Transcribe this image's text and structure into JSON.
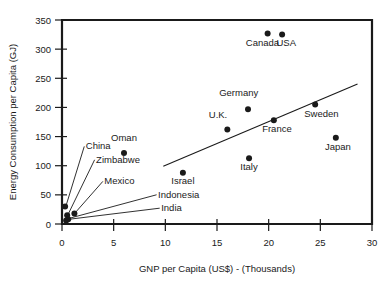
{
  "chart_data": {
    "type": "scatter",
    "title": "",
    "xlabel": "GNP per Capita (US$) - (Thousands)",
    "ylabel": "Energy Consumption per Capita (GJ)",
    "xlim": [
      0,
      30
    ],
    "ylim": [
      0,
      350
    ],
    "xticks": [
      0,
      5,
      10,
      15,
      20,
      25,
      30
    ],
    "yticks": [
      0,
      50,
      100,
      150,
      200,
      250,
      300,
      350
    ],
    "xtick_labels": [
      "0",
      "5",
      "10",
      "15",
      "20",
      "25",
      "30"
    ],
    "ytick_labels": [
      "0",
      "50",
      "100",
      "150",
      "200",
      "250",
      "300",
      "350"
    ],
    "grid": false,
    "legend": false,
    "points": [
      {
        "name": "China",
        "x": 0.3,
        "y": 30,
        "label_x": 2.3,
        "label_y": 128,
        "leader": true
      },
      {
        "name": "Zimbabwe",
        "x": 0.5,
        "y": 15,
        "label_x": 3.3,
        "label_y": 105,
        "leader": true
      },
      {
        "name": "Mexico",
        "x": 1.2,
        "y": 18,
        "label_x": 4.1,
        "label_y": 68,
        "leader": true
      },
      {
        "name": "Indonesia",
        "x": 0.6,
        "y": 8,
        "label_x": 9.3,
        "label_y": 45,
        "leader": true
      },
      {
        "name": "India",
        "x": 0.4,
        "y": 6,
        "label_x": 9.6,
        "label_y": 22,
        "leader": true
      },
      {
        "name": "Oman",
        "x": 6.0,
        "y": 122,
        "label_x": 6.0,
        "label_y": 143,
        "leader": false
      },
      {
        "name": "Israel",
        "x": 11.7,
        "y": 88,
        "label_x": 11.7,
        "label_y": 68,
        "leader": false
      },
      {
        "name": "U.K.",
        "x": 16.0,
        "y": 162,
        "label_x": 15.1,
        "label_y": 182,
        "leader": false
      },
      {
        "name": "Germany",
        "x": 18.0,
        "y": 197,
        "label_x": 17.1,
        "label_y": 220,
        "leader": false
      },
      {
        "name": "Italy",
        "x": 18.1,
        "y": 113,
        "label_x": 18.1,
        "label_y": 93,
        "leader": false
      },
      {
        "name": "France",
        "x": 20.5,
        "y": 178,
        "label_x": 20.8,
        "label_y": 157,
        "leader": false
      },
      {
        "name": "Canada",
        "x": 19.9,
        "y": 327,
        "label_x": 19.4,
        "label_y": 305,
        "leader": false
      },
      {
        "name": "USA",
        "x": 21.3,
        "y": 325,
        "label_x": 21.7,
        "label_y": 305,
        "leader": false
      },
      {
        "name": "Sweden",
        "x": 24.5,
        "y": 205,
        "label_x": 25.1,
        "label_y": 184,
        "leader": false
      },
      {
        "name": "Japan",
        "x": 26.5,
        "y": 148,
        "label_x": 26.7,
        "label_y": 127,
        "leader": false
      }
    ],
    "trend_line": {
      "x0": 9.8,
      "y0": 99,
      "x1": 28.6,
      "y1": 240
    },
    "colors": {
      "ink": "#1a1a1a",
      "background": "#ffffff"
    }
  }
}
